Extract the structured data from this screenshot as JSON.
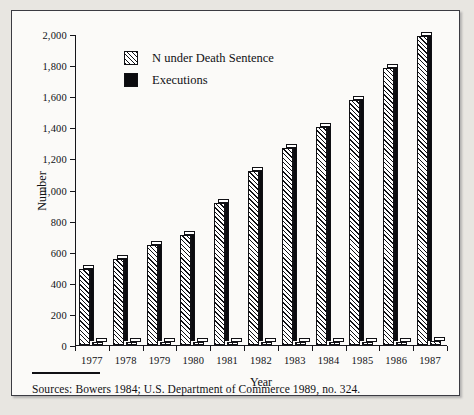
{
  "chart_data": {
    "type": "bar",
    "title": "",
    "xlabel": "Year",
    "ylabel": "Number",
    "categories": [
      "1977",
      "1978",
      "1979",
      "1980",
      "1981",
      "1982",
      "1983",
      "1984",
      "1985",
      "1986",
      "1987"
    ],
    "ylim": [
      0,
      2000
    ],
    "ytick_step": 200,
    "ytick_labels": [
      "0",
      "200",
      "400",
      "600",
      "800",
      "1,000",
      "1,200",
      "1,400",
      "1,600",
      "1,800",
      "2,000"
    ],
    "ytick_values": [
      0,
      200,
      400,
      600,
      800,
      1000,
      1200,
      1400,
      1600,
      1800,
      2000
    ],
    "grid": false,
    "legend_position": "upper-left-inside",
    "series": [
      {
        "name": "N under Death Sentence",
        "pattern": "diagonal-hatch",
        "values": [
          490,
          555,
          640,
          705,
          915,
          1120,
          1265,
          1405,
          1575,
          1780,
          1984
        ]
      },
      {
        "name": "Executions",
        "pattern": "solid-black",
        "values": [
          1,
          0,
          2,
          0,
          1,
          2,
          5,
          21,
          18,
          18,
          25
        ]
      }
    ]
  },
  "legend": {
    "items": [
      {
        "label": "N under Death Sentence",
        "swatch": "hatch"
      },
      {
        "label": "Executions",
        "swatch": "solid"
      }
    ]
  },
  "axes": {
    "ylabel": "Number",
    "xlabel": "Year"
  },
  "note": {
    "source": "Sources: Bowers 1984; U.S. Department of Commerce 1989, no. 324."
  }
}
